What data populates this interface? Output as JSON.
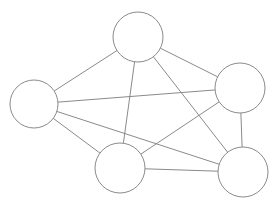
{
  "diagram": {
    "type": "graph",
    "background_color": "#ffffff",
    "stroke_color": "#8a8a8a",
    "node_fill_color": "#ffffff",
    "stroke_width": 1,
    "node_count": 5,
    "edge_count": 10,
    "canvas": {
      "width": 279,
      "height": 206
    },
    "nodes": [
      {
        "id": "n1",
        "label": "",
        "name": "node-top",
        "cx": 138,
        "cy": 37,
        "r": 25
      },
      {
        "id": "n2",
        "label": "",
        "name": "node-left",
        "cx": 34,
        "cy": 104,
        "r": 24
      },
      {
        "id": "n3",
        "label": "",
        "name": "node-upper-right",
        "cx": 240,
        "cy": 88,
        "r": 25
      },
      {
        "id": "n4",
        "label": "",
        "name": "node-bottom-middle",
        "cx": 120,
        "cy": 168,
        "r": 25
      },
      {
        "id": "n5",
        "label": "",
        "name": "node-bottom-right",
        "cx": 243,
        "cy": 172,
        "r": 25
      }
    ],
    "edges": [
      {
        "id": "e1",
        "name": "edge-top-left",
        "source": "n1",
        "target": "n2",
        "x1": 138,
        "y1": 37,
        "x2": 34,
        "y2": 104
      },
      {
        "id": "e2",
        "name": "edge-top-upper-right",
        "source": "n1",
        "target": "n3",
        "x1": 138,
        "y1": 37,
        "x2": 240,
        "y2": 88
      },
      {
        "id": "e3",
        "name": "edge-top-bottom-middle",
        "source": "n1",
        "target": "n4",
        "x1": 138,
        "y1": 37,
        "x2": 120,
        "y2": 168
      },
      {
        "id": "e4",
        "name": "edge-top-bottom-right",
        "source": "n1",
        "target": "n5",
        "x1": 138,
        "y1": 37,
        "x2": 243,
        "y2": 172
      },
      {
        "id": "e5",
        "name": "edge-left-upper-right",
        "source": "n2",
        "target": "n3",
        "x1": 34,
        "y1": 104,
        "x2": 240,
        "y2": 88
      },
      {
        "id": "e6",
        "name": "edge-left-bottom-middle",
        "source": "n2",
        "target": "n4",
        "x1": 34,
        "y1": 104,
        "x2": 120,
        "y2": 168
      },
      {
        "id": "e7",
        "name": "edge-left-bottom-right",
        "source": "n2",
        "target": "n5",
        "x1": 34,
        "y1": 104,
        "x2": 243,
        "y2": 172
      },
      {
        "id": "e8",
        "name": "edge-upper-right-bottom-middle",
        "source": "n3",
        "target": "n4",
        "x1": 240,
        "y1": 88,
        "x2": 120,
        "y2": 168
      },
      {
        "id": "e9",
        "name": "edge-upper-right-bottom-right",
        "source": "n3",
        "target": "n5",
        "x1": 240,
        "y1": 88,
        "x2": 243,
        "y2": 172
      },
      {
        "id": "e10",
        "name": "edge-bottom-middle-bottom-right",
        "source": "n4",
        "target": "n5",
        "x1": 120,
        "y1": 168,
        "x2": 243,
        "y2": 172
      }
    ]
  }
}
